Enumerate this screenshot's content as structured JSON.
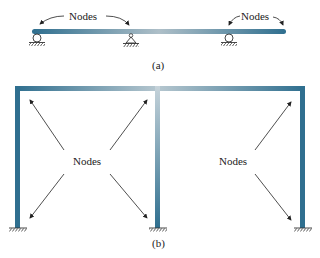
{
  "figure_a": {
    "caption": "(a)",
    "node_labels": [
      "Nodes",
      "Nodes"
    ],
    "supports": [
      "roller",
      "pin",
      "roller"
    ]
  },
  "figure_b": {
    "caption": "(b)",
    "node_labels": [
      "Nodes",
      "Nodes"
    ],
    "supports": [
      "fixed",
      "fixed",
      "fixed"
    ]
  },
  "colors": {
    "member": "#2f6f8f",
    "member_highlight": "#c9d6dd",
    "arrow": "#222222",
    "text": "#222222"
  }
}
